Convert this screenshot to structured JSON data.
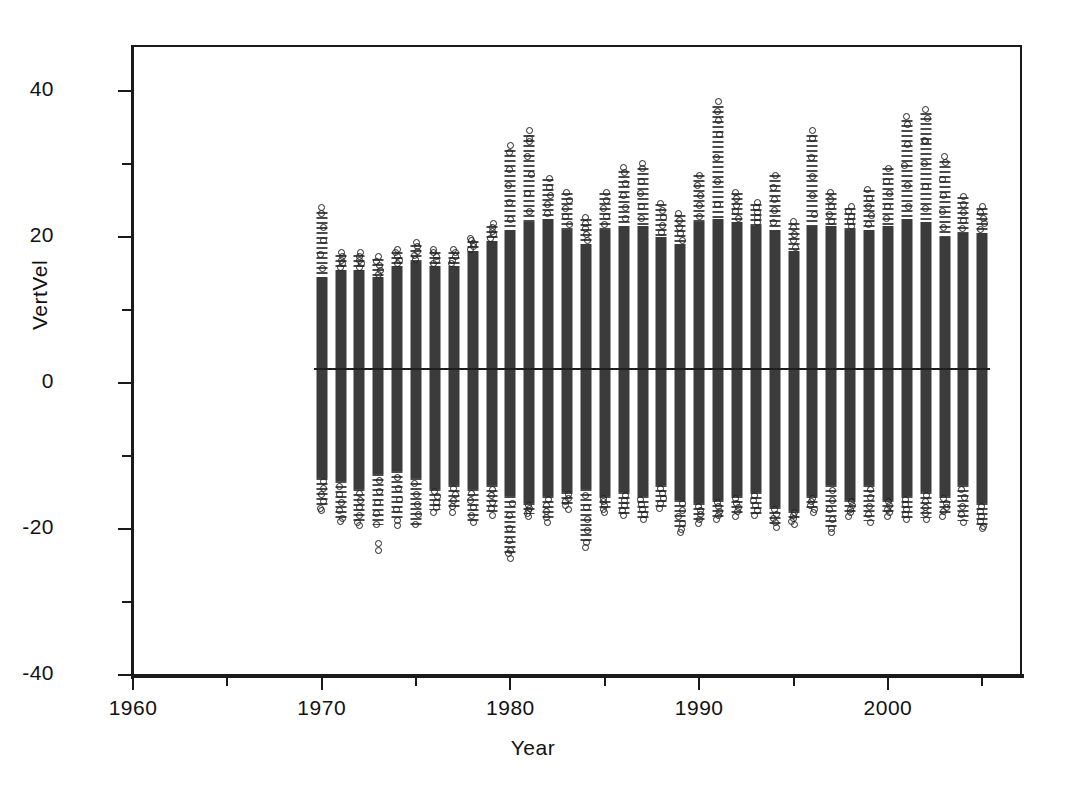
{
  "figure": {
    "background": "#ffffff",
    "frame_color": "#1a1a1a",
    "marker_color": "#222222",
    "column_color": "#3b3b3b",
    "reference_line_color": "#1f1f1f"
  },
  "chart_data": {
    "type": "scatter",
    "title": "",
    "subtitle": "",
    "xlabel": "Year",
    "ylabel": "VertVel",
    "xlim": [
      1960,
      2007
    ],
    "ylim": [
      -40,
      46
    ],
    "xticks": [
      1960,
      1970,
      1980,
      1990,
      2000
    ],
    "xtick_labels": [
      "1960",
      "1970",
      "1980",
      "1990",
      "2000"
    ],
    "xminor_ticks": [
      1965,
      1975,
      1985,
      1995,
      2005
    ],
    "yticks": [
      40,
      20,
      0,
      -20,
      -40
    ],
    "ytick_labels": [
      "40",
      "20",
      "0",
      "-20",
      "-40"
    ],
    "yminor_ticks": [
      30,
      10,
      -10,
      -30
    ],
    "grid": false,
    "legend": null,
    "marker": "open-circle",
    "annotations": [
      {
        "kind": "horizontal-reference-line",
        "y": 2.0,
        "x_start": 1969.6,
        "x_end": 2005.4
      }
    ],
    "series": [
      {
        "name": "VertVel",
        "x": [
          1970,
          1971,
          1972,
          1973,
          1974,
          1975,
          1976,
          1977,
          1978,
          1979,
          1980,
          1981,
          1982,
          1983,
          1984,
          1985,
          1986,
          1987,
          1988,
          1989,
          1990,
          1991,
          1992,
          1993,
          1994,
          1995,
          1996,
          1997,
          1998,
          1999,
          2000,
          2001,
          2002,
          2003,
          2004,
          2005
        ],
        "core_min": [
          -13.0,
          -13.5,
          -14.5,
          -12.5,
          -12.0,
          -13.0,
          -14.5,
          -14.0,
          -14.5,
          -14.0,
          -15.5,
          -16.5,
          -15.5,
          -15.0,
          -14.5,
          -15.5,
          -15.0,
          -15.5,
          -14.0,
          -16.0,
          -16.5,
          -16.0,
          -15.5,
          -15.0,
          -17.0,
          -17.5,
          -15.5,
          -14.0,
          -16.0,
          -14.0,
          -16.0,
          -15.5,
          -15.0,
          -15.5,
          -14.0,
          -16.5
        ],
        "core_max": [
          14.5,
          15.5,
          15.5,
          14.5,
          16.0,
          16.5,
          16.0,
          16.0,
          18.0,
          19.5,
          21.0,
          22.0,
          22.5,
          21.0,
          19.0,
          21.0,
          21.5,
          21.5,
          20.0,
          19.0,
          22.0,
          22.5,
          22.0,
          21.5,
          21.0,
          18.0,
          21.5,
          21.5,
          21.0,
          21.0,
          21.5,
          22.5,
          22.0,
          20.0,
          20.5,
          20.5
        ],
        "whisker_min": [
          -17.5,
          -19.0,
          -19.5,
          -20.0,
          -19.5,
          -20.0,
          -18.0,
          -18.0,
          -19.5,
          -18.5,
          -24.0,
          -18.5,
          -19.5,
          -17.5,
          -22.5,
          -18.0,
          -18.5,
          -19.0,
          -17.5,
          -20.5,
          -19.5,
          -19.0,
          -18.5,
          -18.5,
          -20.0,
          -19.5,
          -18.0,
          -20.5,
          -18.5,
          -19.5,
          -18.5,
          -19.0,
          -19.0,
          -18.5,
          -19.5,
          -20.0
        ],
        "whisker_max": [
          24.0,
          18.0,
          18.0,
          17.5,
          18.5,
          19.5,
          18.5,
          18.5,
          20.0,
          22.0,
          32.5,
          34.5,
          28.5,
          26.5,
          23.0,
          26.5,
          29.5,
          30.0,
          25.0,
          23.5,
          29.0,
          38.5,
          26.5,
          25.0,
          29.0,
          22.5,
          34.5,
          26.5,
          24.5,
          27.0,
          30.0,
          36.5,
          37.5,
          31.0,
          26.0,
          24.5
        ]
      }
    ],
    "high_outliers": [
      {
        "x": 1970,
        "y": 24.0
      },
      {
        "x": 1980,
        "y": 32.5
      },
      {
        "x": 1981,
        "y": 34.5
      },
      {
        "x": 1981,
        "y": 33.0
      },
      {
        "x": 1986,
        "y": 29.5
      },
      {
        "x": 1987,
        "y": 30.0
      },
      {
        "x": 1991,
        "y": 38.5
      },
      {
        "x": 1991,
        "y": 36.0
      },
      {
        "x": 1996,
        "y": 34.5
      },
      {
        "x": 2001,
        "y": 36.5
      },
      {
        "x": 2002,
        "y": 37.5
      },
      {
        "x": 2002,
        "y": 33.0
      },
      {
        "x": 2003,
        "y": 31.0
      }
    ],
    "low_outliers": [
      {
        "x": 1970,
        "y": -17.5
      },
      {
        "x": 1971,
        "y": -19.0
      },
      {
        "x": 1972,
        "y": -19.5
      },
      {
        "x": 1973,
        "y": -23.0
      },
      {
        "x": 1973,
        "y": -22.0
      },
      {
        "x": 1974,
        "y": -19.5
      },
      {
        "x": 1980,
        "y": -24.0
      },
      {
        "x": 1980,
        "y": -23.0
      },
      {
        "x": 1984,
        "y": -22.5
      },
      {
        "x": 1989,
        "y": -20.5
      },
      {
        "x": 1997,
        "y": -20.5
      },
      {
        "x": 2005,
        "y": -20.0
      }
    ]
  }
}
